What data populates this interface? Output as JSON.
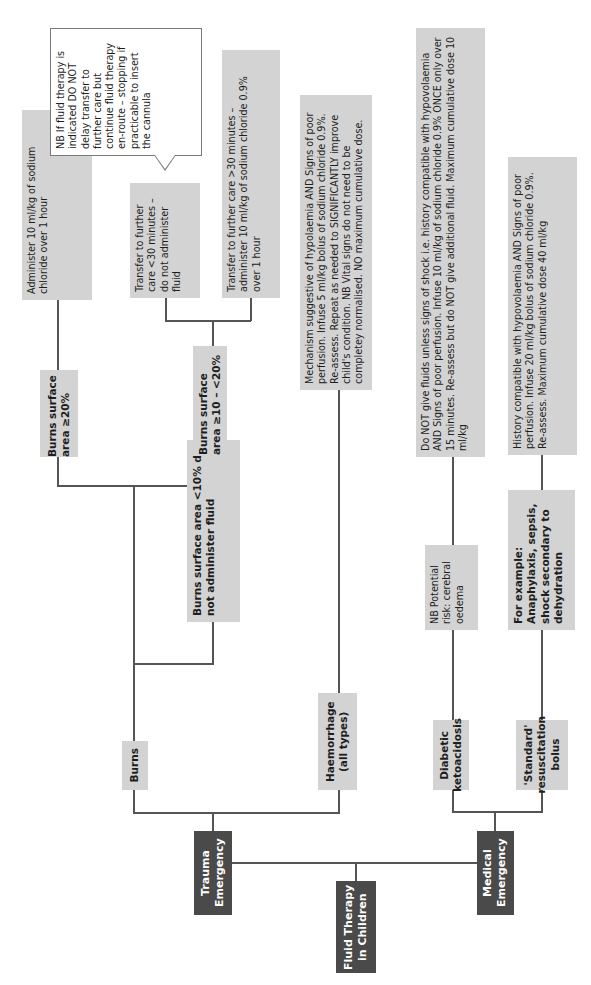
{
  "colors": {
    "root_box": "#4a4a4a",
    "category_box": "#d3d3d3",
    "connector": "#555555",
    "callout_border": "#7a7a7a"
  },
  "root": {
    "title": "Fluid Therapy in Children"
  },
  "trauma": {
    "title": "Trauma Emergency",
    "burns": {
      "title": "Burns",
      "ge20": {
        "title": "Burns surface area ≥20%",
        "action": "Administer 10 ml/kg of sodium chloride over 1 hour"
      },
      "ge10_lt20": {
        "title": "Burns surface area ≥10 – <20%",
        "lt30": "Transfer to further care <30 minutes – do not administer fluid",
        "gt30": "Transfer to further care >30 minutes – administer 10 ml/kg of sodium chloride 0.9% over 1 hour",
        "note": "NB If fluid therapy is indicated DO NOT delay transfer to further care but continue fluid therapy en-route – stopping if practicable to insert the cannula"
      },
      "lt10": {
        "title": "Burns surface area <10% do not administer fluid"
      }
    },
    "haemorrhage": {
      "title": "Haemorrhage (all types)",
      "action": "Mechanism suggestive of hypolaemia AND Signs of poor perfusion. Infuse 5 ml/kg bolus of sodium chloride 0.9%. Re-assess. Repeat as needed to SIGNIFICANTLY improve child's condition. NB Vital signs do not need to be completey normalised. NO maximum cumulative dose."
    }
  },
  "medical": {
    "title": "Medical Emergency",
    "dka": {
      "title": "Diabetic ketoacidosis",
      "note": "NB Potential risk: cerebral oedema",
      "action": "Do NOT give fluids unless signs of shock i.e. history compatible with hypovolaemia AND Signs of poor perfusion. Infuse 10 ml/kg of sodium chloride 0.9% ONCE only over 15 minutes. Re-assess but do NOT give additional fluid. Maximum cumulative dose 10 ml/kg"
    },
    "standard": {
      "title": "'Standard' resuscitation bolus",
      "examples": "For example: Anaphylaxis, sepsis, shock secondary to dehydration",
      "action": "History compatible with hypovolaemia AND Signs of poor perfusion. Infuse 20 ml/kg bolus of sodium chloride 0.9%. Re-assess. Maximum cumulative dose 40 ml/kg"
    }
  }
}
